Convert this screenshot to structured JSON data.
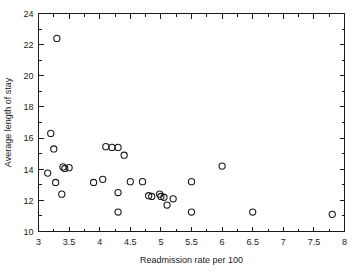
{
  "chart_data": {
    "type": "scatter",
    "title": "",
    "subtitle": "",
    "xlabel": "Readmission rate per 100",
    "ylabel": "Average length of stay",
    "xlim": [
      3,
      8
    ],
    "ylim": [
      10,
      24
    ],
    "x_major_ticks": [
      3,
      3.5,
      4,
      4.5,
      5,
      5.5,
      6,
      6.5,
      7,
      7.5,
      8
    ],
    "x_major_tick_labels": [
      "3",
      "3.5",
      "4",
      "4.5",
      "5",
      "5.5",
      "6",
      "6.5",
      "7",
      "7.5",
      "8"
    ],
    "x_minor_ticks": [
      3.25,
      3.75,
      4.25,
      4.75,
      5.25,
      5.75,
      6.25,
      6.75,
      7.25,
      7.75
    ],
    "y_major_ticks": [
      10,
      12,
      14,
      16,
      18,
      20,
      22,
      24
    ],
    "y_major_tick_labels": [
      "10",
      "12",
      "14",
      "16",
      "18",
      "20",
      "22",
      "24"
    ],
    "y_minor_ticks": [
      11,
      13,
      15,
      17,
      19,
      21,
      23
    ],
    "grid": false,
    "legend": false,
    "legend_position": "none",
    "marker": {
      "shape": "open-circle",
      "radius": 3.1,
      "fill": "none",
      "stroke": "#1a1a1a",
      "stroke_width": 1.1
    },
    "colors": {
      "axis": "#1a1a1a",
      "marker_stroke": "#1a1a1a",
      "background": "#ffffff"
    },
    "points": [
      {
        "x": 3.3,
        "y": 22.4
      },
      {
        "x": 3.2,
        "y": 16.3
      },
      {
        "x": 3.25,
        "y": 15.3
      },
      {
        "x": 3.15,
        "y": 13.75
      },
      {
        "x": 3.28,
        "y": 13.15
      },
      {
        "x": 3.4,
        "y": 14.15
      },
      {
        "x": 3.43,
        "y": 14.05
      },
      {
        "x": 3.5,
        "y": 14.1
      },
      {
        "x": 3.38,
        "y": 12.4
      },
      {
        "x": 3.9,
        "y": 13.15
      },
      {
        "x": 4.05,
        "y": 13.35
      },
      {
        "x": 4.1,
        "y": 15.45
      },
      {
        "x": 4.2,
        "y": 15.4
      },
      {
        "x": 4.3,
        "y": 15.4
      },
      {
        "x": 4.4,
        "y": 14.9
      },
      {
        "x": 4.3,
        "y": 12.5
      },
      {
        "x": 4.3,
        "y": 11.25
      },
      {
        "x": 4.5,
        "y": 13.2
      },
      {
        "x": 4.7,
        "y": 13.2
      },
      {
        "x": 4.8,
        "y": 12.3
      },
      {
        "x": 4.85,
        "y": 12.25
      },
      {
        "x": 4.98,
        "y": 12.4
      },
      {
        "x": 5.0,
        "y": 12.25
      },
      {
        "x": 5.05,
        "y": 12.2
      },
      {
        "x": 5.1,
        "y": 11.7
      },
      {
        "x": 5.2,
        "y": 12.1
      },
      {
        "x": 5.5,
        "y": 13.2
      },
      {
        "x": 5.5,
        "y": 11.25
      },
      {
        "x": 6.0,
        "y": 14.2
      },
      {
        "x": 6.5,
        "y": 11.25
      },
      {
        "x": 7.8,
        "y": 11.1
      }
    ]
  },
  "figure": {
    "width": 355,
    "height": 273
  }
}
